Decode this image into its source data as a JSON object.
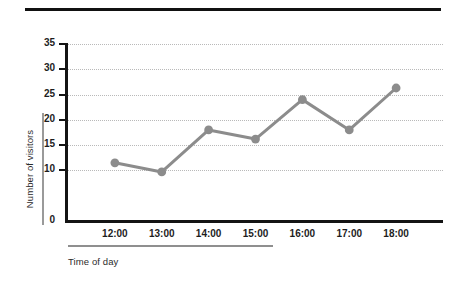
{
  "figure": {
    "type": "line-chart",
    "y_axis_title": "Number of visitors",
    "x_axis_title": "Time of day"
  },
  "chart_data": {
    "type": "line",
    "title": "",
    "subtitle": "",
    "xlabel": "Time of day",
    "ylabel": "Number of visitors",
    "categories": [
      "12:00",
      "13:00",
      "14:00",
      "15:00",
      "16:00",
      "17:00",
      "18:00"
    ],
    "values": [
      11.5,
      9.7,
      18,
      16.2,
      24,
      18,
      26.3
    ],
    "series": [
      {
        "name": "Number of visitors",
        "values": [
          11.5,
          9.7,
          18,
          16.2,
          24,
          18,
          26.3
        ],
        "color": "#8c8c8c",
        "marker": "circle",
        "line_width": 3
      }
    ],
    "ylim": [
      0,
      35
    ],
    "xlim": [
      0,
      8
    ],
    "y_ticks": [
      0,
      10,
      15,
      20,
      25,
      30,
      35
    ],
    "y_tick_labels": [
      "0",
      "10",
      "15",
      "20",
      "25",
      "30",
      "35"
    ],
    "x_tick_labels": [
      "12:00",
      "13:00",
      "14:00",
      "15:00",
      "16:00",
      "17:00",
      "18:00"
    ],
    "grid": true,
    "grid_style": "dotted",
    "grid_axis": "y",
    "grid_color": "#b9b9b9",
    "legend": false,
    "legend_position": "none",
    "axis_color": "#141414",
    "background": "#ffffff",
    "annotations": []
  },
  "ticks": {
    "y": [
      {
        "label": "35",
        "value": 35
      },
      {
        "label": "30",
        "value": 30
      },
      {
        "label": "25",
        "value": 25
      },
      {
        "label": "20",
        "value": 20
      },
      {
        "label": "15",
        "value": 15
      },
      {
        "label": "10",
        "value": 10
      },
      {
        "label": "0",
        "value": 0
      }
    ],
    "x": [
      {
        "label": "12:00"
      },
      {
        "label": "13:00"
      },
      {
        "label": "14:00"
      },
      {
        "label": "15:00"
      },
      {
        "label": "16:00"
      },
      {
        "label": "17:00"
      },
      {
        "label": "18:00"
      }
    ]
  },
  "colors": {
    "series": "#8c8c8c",
    "axis": "#141414",
    "grid": "#b9b9b9",
    "rule": "#111111",
    "text": "#1d1d1d"
  }
}
